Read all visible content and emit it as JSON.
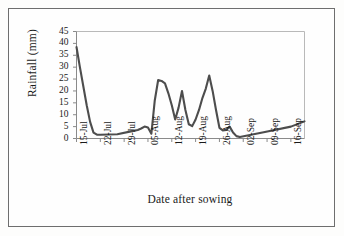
{
  "figure": {
    "name": "rainfall-line-chart"
  },
  "chart_data": {
    "type": "line",
    "title": "",
    "xlabel": "Date after sowing",
    "ylabel": "Rainfall  (mm)",
    "ylim": [
      0,
      45
    ],
    "yticks": [
      0,
      5,
      10,
      15,
      20,
      25,
      30,
      35,
      40,
      45
    ],
    "grid": false,
    "legend": false,
    "line_color": "#4d4d4d",
    "x_tick_labels": [
      "15-Jul",
      "22-Jul",
      "29-Jul",
      "05-Aug",
      "12-Aug",
      "19-Aug",
      "26-Aug",
      "02-Sep",
      "09-Sep",
      "16-Sep"
    ],
    "x_tick_positions": [
      0,
      7,
      14,
      21,
      28,
      35,
      42,
      49,
      56,
      63
    ],
    "x": [
      0,
      1,
      2,
      3,
      4,
      5,
      6,
      7,
      12,
      16,
      18,
      19,
      20,
      21,
      22,
      23,
      24,
      25,
      26,
      27,
      28,
      29,
      30,
      31,
      32,
      33,
      34,
      35,
      36,
      37,
      38,
      39,
      40,
      41,
      42,
      43,
      44,
      45,
      46,
      47,
      48,
      55,
      63,
      67
    ],
    "values": [
      38.5,
      30,
      22,
      14,
      7,
      2.5,
      1.6,
      1.6,
      1.8,
      3.0,
      3.6,
      4.2,
      5.0,
      4.6,
      2.0,
      16,
      24.6,
      24.2,
      23.2,
      19,
      14,
      8,
      13,
      20,
      12,
      6,
      5.2,
      8,
      12,
      17,
      21,
      26.5,
      20,
      12,
      4.5,
      3.4,
      3.6,
      5.0,
      2.5,
      1.0,
      0.6,
      2.6,
      5.0,
      7.2
    ],
    "series_name": "Rainfall"
  }
}
